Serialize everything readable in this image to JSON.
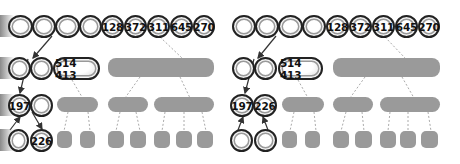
{
  "panels": [
    {
      "name": "left",
      "row1": [
        "",
        "",
        "",
        "",
        "128",
        "372",
        "311",
        "645",
        "270"
      ],
      "row2": {
        "empty_nodes": 2,
        "pair": "514 413"
      },
      "row3": [
        "197",
        ""
      ],
      "row4": [
        "",
        "226"
      ]
    },
    {
      "name": "right",
      "row1": [
        "",
        "",
        "",
        "",
        "128",
        "372",
        "311",
        "645",
        "270"
      ],
      "row2": {
        "empty_nodes": 2,
        "pair": "514 413"
      },
      "row3": [
        "197",
        "226"
      ],
      "row4": [
        "",
        ""
      ]
    }
  ],
  "colors": {
    "gray_block": "#9a9a9a",
    "outline": "#222222",
    "arrow": "#333333"
  }
}
